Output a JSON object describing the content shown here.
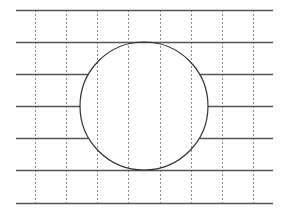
{
  "diagram": {
    "colors": {
      "background": "#ffffff",
      "horizontal_line": "#555555",
      "vertical_line": "#888888",
      "circle": "#333333"
    },
    "horizontal_lines_y": [
      10,
      42,
      74,
      106,
      138,
      170,
      203
    ],
    "horizontal_x_range": [
      16,
      273
    ],
    "vertical_lines_x": [
      35,
      66,
      97,
      128,
      160,
      191,
      222,
      253
    ],
    "vertical_y_range": [
      10,
      203
    ],
    "circle": {
      "cx": 144,
      "cy": 106,
      "r": 64
    }
  }
}
